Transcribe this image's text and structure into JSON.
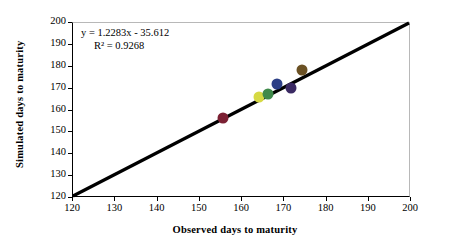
{
  "chart_data": {
    "type": "scatter",
    "title": "",
    "xlabel": "Observed days to maturity",
    "ylabel": "Simulated days to maturity",
    "xlim": [
      120,
      200
    ],
    "ylim": [
      120,
      200
    ],
    "xticks": [
      120,
      130,
      140,
      150,
      160,
      170,
      180,
      190,
      200
    ],
    "yticks": [
      120,
      130,
      140,
      150,
      160,
      170,
      180,
      190,
      200
    ],
    "grid": false,
    "legend": "none",
    "annotations": {
      "equation": "y = 1.2283x - 35.612",
      "r_squared": "R² = 0.9268"
    },
    "reference_line": {
      "label": "1:1 line",
      "from": [
        120,
        120
      ],
      "to": [
        200,
        200
      ],
      "color": "#000000"
    },
    "points": [
      {
        "label": "point-1",
        "x": 155.5,
        "y": 156.5,
        "color": "#7b2033"
      },
      {
        "label": "point-2",
        "x": 164.0,
        "y": 166.0,
        "color": "#d6d943"
      },
      {
        "label": "point-3",
        "x": 166.2,
        "y": 167.6,
        "color": "#3f8a4a"
      },
      {
        "label": "point-4",
        "x": 168.2,
        "y": 172.0,
        "color": "#2c3f86"
      },
      {
        "label": "point-5",
        "x": 171.6,
        "y": 170.4,
        "color": "#3b2a63"
      },
      {
        "label": "point-6",
        "x": 174.2,
        "y": 178.6,
        "color": "#6b5124"
      }
    ]
  }
}
